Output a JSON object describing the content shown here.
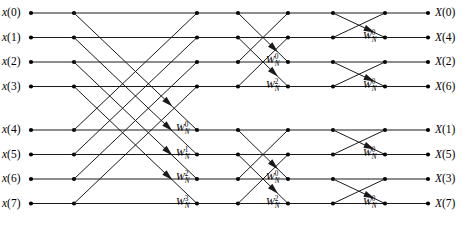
{
  "diagram": {
    "type": "fft-butterfly",
    "n_points": 8,
    "stages": 3,
    "colors": {
      "line": "#1a1a1a",
      "node": "#000000",
      "background": "#ffffff",
      "text": "#000000"
    },
    "geometry": {
      "width": 462,
      "height": 234,
      "row_y": [
        13,
        37.5,
        62,
        86.5,
        130,
        154.5,
        179,
        203.5
      ],
      "col_x": [
        31,
        74,
        197,
        238,
        288,
        333,
        385,
        428
      ],
      "node_radius": 2.1,
      "line_width": 1.0
    }
  },
  "inputs": [
    {
      "label": "x(0)",
      "var": "x",
      "index": "(0)",
      "row": 0
    },
    {
      "label": "x(1)",
      "var": "x",
      "index": "(1)",
      "row": 1
    },
    {
      "label": "x(2)",
      "var": "x",
      "index": "(2)",
      "row": 2
    },
    {
      "label": "x(3)",
      "var": "x",
      "index": "(3)",
      "row": 3
    },
    {
      "label": "x(4)",
      "var": "x",
      "index": "(4)",
      "row": 4
    },
    {
      "label": "x(5)",
      "var": "x",
      "index": "(5)",
      "row": 5
    },
    {
      "label": "x(6)",
      "var": "x",
      "index": "(6)",
      "row": 6
    },
    {
      "label": "x(7)",
      "var": "x",
      "index": "(7)",
      "row": 7
    }
  ],
  "outputs": [
    {
      "label": "X(0)",
      "var": "X",
      "index": "(0)",
      "row": 0
    },
    {
      "label": "X(4)",
      "var": "X",
      "index": "(4)",
      "row": 1
    },
    {
      "label": "X(2)",
      "var": "X",
      "index": "(2)",
      "row": 2
    },
    {
      "label": "X(6)",
      "var": "X",
      "index": "(6)",
      "row": 3
    },
    {
      "label": "X(1)",
      "var": "X",
      "index": "(1)",
      "row": 4
    },
    {
      "label": "X(5)",
      "var": "X",
      "index": "(5)",
      "row": 5
    },
    {
      "label": "X(3)",
      "var": "X",
      "index": "(3)",
      "row": 6
    },
    {
      "label": "X(7)",
      "var": "X",
      "index": "(7)",
      "row": 7
    }
  ],
  "twiddles": [
    {
      "base": "W",
      "sub": "N",
      "exp": "0",
      "stage": 1,
      "row": 4,
      "x": 176,
      "y": 130
    },
    {
      "base": "W",
      "sub": "N",
      "exp": "1",
      "stage": 1,
      "row": 5,
      "x": 176,
      "y": 154.5
    },
    {
      "base": "W",
      "sub": "N",
      "exp": "2",
      "stage": 1,
      "row": 6,
      "x": 176,
      "y": 179
    },
    {
      "base": "W",
      "sub": "N",
      "exp": "3",
      "stage": 1,
      "row": 7,
      "x": 176,
      "y": 203.5
    },
    {
      "base": "W",
      "sub": "N",
      "exp": "0",
      "stage": 2,
      "row": 2,
      "x": 266,
      "y": 62
    },
    {
      "base": "W",
      "sub": "N",
      "exp": "2",
      "stage": 2,
      "row": 3,
      "x": 266,
      "y": 86.5
    },
    {
      "base": "W",
      "sub": "N",
      "exp": "0",
      "stage": 2,
      "row": 6,
      "x": 266,
      "y": 179
    },
    {
      "base": "W",
      "sub": "N",
      "exp": "2",
      "stage": 2,
      "row": 7,
      "x": 266,
      "y": 203.5
    },
    {
      "base": "W",
      "sub": "N",
      "exp": "0",
      "stage": 3,
      "row": 1,
      "x": 363,
      "y": 37.5
    },
    {
      "base": "W",
      "sub": "N",
      "exp": "0",
      "stage": 3,
      "row": 3,
      "x": 363,
      "y": 86.5
    },
    {
      "base": "W",
      "sub": "N",
      "exp": "0",
      "stage": 3,
      "row": 5,
      "x": 363,
      "y": 154.5
    },
    {
      "base": "W",
      "sub": "N",
      "exp": "0",
      "stage": 3,
      "row": 7,
      "x": 363,
      "y": 203.5
    }
  ],
  "graph": {
    "stage1": {
      "from_col": 1,
      "to_col": 2,
      "span": 4,
      "pairs": [
        [
          0,
          0
        ],
        [
          0,
          4
        ],
        [
          1,
          1
        ],
        [
          1,
          5
        ],
        [
          2,
          2
        ],
        [
          2,
          6
        ],
        [
          3,
          3
        ],
        [
          3,
          7
        ],
        [
          4,
          0
        ],
        [
          4,
          4
        ],
        [
          5,
          1
        ],
        [
          5,
          5
        ],
        [
          6,
          2
        ],
        [
          6,
          6
        ],
        [
          7,
          3
        ],
        [
          7,
          7
        ]
      ],
      "arrow_rows": [
        4,
        5,
        6,
        7
      ]
    },
    "stage2": {
      "from_col": 3,
      "to_col": 4,
      "span": 2,
      "pairs": [
        [
          0,
          0
        ],
        [
          0,
          2
        ],
        [
          1,
          1
        ],
        [
          1,
          3
        ],
        [
          2,
          0
        ],
        [
          2,
          2
        ],
        [
          3,
          1
        ],
        [
          3,
          3
        ],
        [
          4,
          4
        ],
        [
          4,
          6
        ],
        [
          5,
          5
        ],
        [
          5,
          7
        ],
        [
          6,
          4
        ],
        [
          6,
          6
        ],
        [
          7,
          5
        ],
        [
          7,
          7
        ]
      ],
      "arrow_rows": [
        2,
        3,
        6,
        7
      ]
    },
    "stage3": {
      "from_col": 5,
      "to_col": 6,
      "span": 1,
      "pairs": [
        [
          0,
          0
        ],
        [
          0,
          1
        ],
        [
          1,
          0
        ],
        [
          1,
          1
        ],
        [
          2,
          2
        ],
        [
          2,
          3
        ],
        [
          3,
          2
        ],
        [
          3,
          3
        ],
        [
          4,
          4
        ],
        [
          4,
          5
        ],
        [
          5,
          4
        ],
        [
          5,
          5
        ],
        [
          6,
          6
        ],
        [
          6,
          7
        ],
        [
          7,
          6
        ],
        [
          7,
          7
        ]
      ],
      "arrow_rows": [
        1,
        3,
        5,
        7
      ]
    },
    "straight_segments": [
      [
        0,
        1
      ],
      [
        2,
        3
      ],
      [
        4,
        5
      ],
      [
        6,
        7
      ]
    ]
  }
}
